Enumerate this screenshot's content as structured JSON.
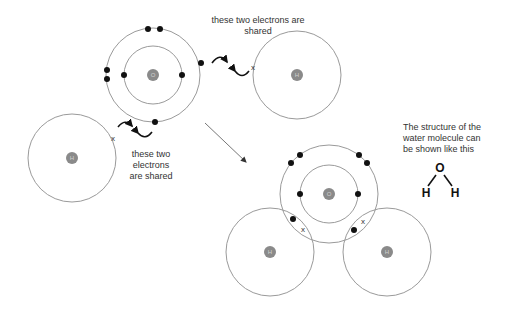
{
  "colors": {
    "shell": "#9a9a9a",
    "nucleus": "#8a8a8a",
    "electron": "#111111",
    "text": "#333333"
  },
  "labels": {
    "shared_top": "these two electrons are shared",
    "shared_left": "these two electrons are shared",
    "structure_caption": "The structure of the water molecule can be shown like this"
  },
  "atoms": {
    "oxygen_symbol": "O",
    "hydrogen_symbol": "H"
  },
  "structural_formula": {
    "center": "O",
    "left": "H",
    "right": "H"
  },
  "cross_symbol": "x"
}
